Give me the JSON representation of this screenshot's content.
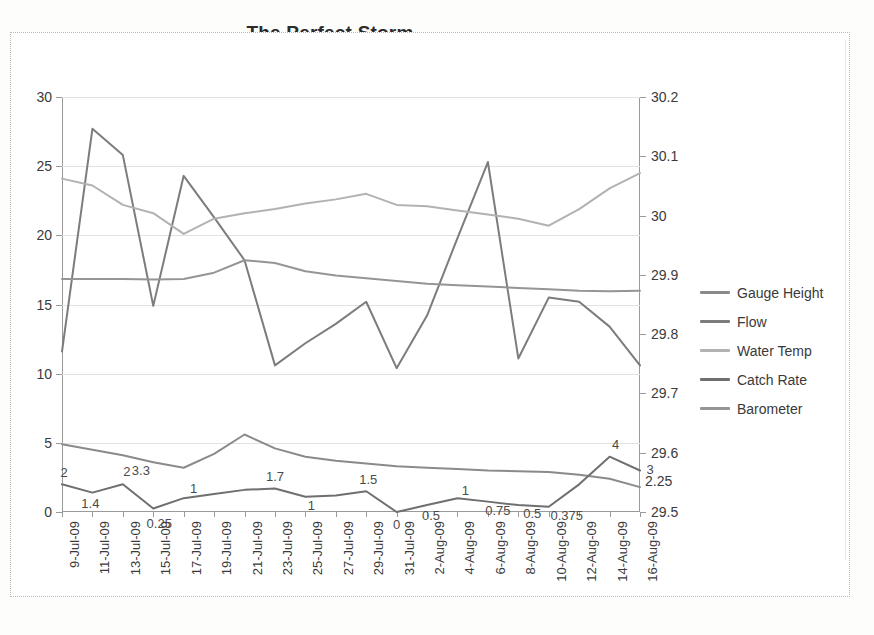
{
  "chart": {
    "title": "The Perfect Storm",
    "frame_border": "dotted",
    "background": "#ffffff"
  },
  "legend": {
    "position": "right",
    "items": [
      {
        "label": "Gauge Height",
        "color": "#8a8a8a"
      },
      {
        "label": "Flow",
        "color": "#7c7c7c"
      },
      {
        "label": "Water Temp",
        "color": "#b2b2b2"
      },
      {
        "label": "Catch Rate",
        "color": "#6f6f6f"
      },
      {
        "label": "Barometer",
        "color": "#959595"
      }
    ]
  },
  "axes": {
    "left": {
      "min": 0,
      "max": 30,
      "step": 5,
      "ticks": [
        "0",
        "5",
        "10",
        "15",
        "20",
        "25",
        "30"
      ]
    },
    "right": {
      "min": 29.5,
      "max": 30.2,
      "step": 0.1,
      "ticks": [
        "29.5",
        "29.6",
        "29.7",
        "29.8",
        "29.9",
        "30",
        "30.1",
        "30.2"
      ],
      "stray_label": "2.25"
    },
    "x": {
      "labels": [
        "9-Jul-09",
        "11-Jul-09",
        "13-Jul-09",
        "15-Jul-09",
        "17-Jul-09",
        "19-Jul-09",
        "21-Jul-09",
        "23-Jul-09",
        "25-Jul-09",
        "27-Jul-09",
        "29-Jul-09",
        "31-Jul-09",
        "2-Aug-09",
        "4-Aug-09",
        "6-Aug-09",
        "8-Aug-09",
        "10-Aug-09",
        "12-Aug-09",
        "14-Aug-09",
        "16-Aug-09"
      ]
    }
  },
  "chart_data": {
    "type": "line",
    "title": "The Perfect Storm",
    "xlabel": "",
    "ylabel": "",
    "ylim": [
      0,
      30
    ],
    "y2lim": [
      29.5,
      30.2
    ],
    "grid": true,
    "legend_position": "right",
    "x": [
      "9-Jul-09",
      "11-Jul-09",
      "13-Jul-09",
      "15-Jul-09",
      "17-Jul-09",
      "19-Jul-09",
      "21-Jul-09",
      "23-Jul-09",
      "25-Jul-09",
      "27-Jul-09",
      "29-Jul-09",
      "31-Jul-09",
      "2-Aug-09",
      "4-Aug-09",
      "6-Aug-09",
      "8-Aug-09",
      "10-Aug-09",
      "12-Aug-09",
      "14-Aug-09",
      "16-Aug-09"
    ],
    "series": [
      {
        "name": "Gauge Height",
        "axis": "left",
        "color": "#8a8a8a",
        "values": [
          4.9,
          4.5,
          4.1,
          3.6,
          3.2,
          4.2,
          5.6,
          4.6,
          4.0,
          3.7,
          3.5,
          3.3,
          3.2,
          3.1,
          3.0,
          2.95,
          2.9,
          2.7,
          2.4,
          1.8
        ]
      },
      {
        "name": "Flow",
        "axis": "left",
        "color": "#7c7c7c",
        "values": [
          11.6,
          27.7,
          25.8,
          14.9,
          24.3,
          21.3,
          18.2,
          10.6,
          12.2,
          13.6,
          15.2,
          10.4,
          14.2,
          19.8,
          25.3,
          11.1,
          15.5,
          15.2,
          13.4,
          10.6
        ]
      },
      {
        "name": "Water Temp",
        "axis": "left",
        "color": "#b2b2b2",
        "values": [
          24.1,
          23.6,
          22.2,
          21.6,
          20.1,
          21.2,
          21.6,
          21.9,
          22.3,
          22.6,
          23.0,
          22.2,
          22.1,
          21.8,
          21.5,
          21.2,
          20.7,
          21.9,
          23.4,
          24.5
        ]
      },
      {
        "name": "Catch Rate",
        "axis": "left",
        "color": "#6f6f6f",
        "values": [
          2.0,
          1.4,
          2.0,
          0.25,
          1.0,
          1.3,
          1.6,
          1.7,
          1.1,
          1.2,
          1.5,
          0.0,
          0.5,
          1.0,
          0.75,
          0.5,
          0.375,
          2.0,
          4.0,
          3.0
        ],
        "data_labels": [
          "2",
          "1.4",
          "2",
          "0.25",
          "1",
          "",
          "",
          "1.7",
          "1",
          "",
          "1.5",
          "0",
          "0.5",
          "1",
          "0.75",
          "0.5",
          "0.375",
          "",
          "4",
          "3"
        ],
        "extra_labels": [
          "3.3",
          "2.25"
        ]
      },
      {
        "name": "Barometer",
        "axis": "right",
        "color": "#959595",
        "values": [
          29.895,
          29.895,
          29.895,
          29.893,
          29.895,
          29.905,
          29.918,
          29.925,
          29.912,
          29.905,
          29.9,
          29.895,
          29.89,
          29.887,
          29.884,
          29.882,
          29.88,
          29.878,
          29.878,
          29.882
        ],
        "left_equivalent": [
          16.85,
          16.85,
          16.85,
          16.8,
          16.85,
          17.3,
          18.2,
          18.0,
          17.4,
          17.1,
          16.9,
          16.7,
          16.5,
          16.4,
          16.3,
          16.2,
          16.1,
          16.0,
          15.95,
          16.0
        ]
      }
    ]
  }
}
